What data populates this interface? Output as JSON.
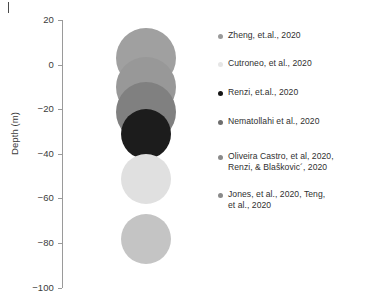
{
  "chart_data": {
    "type": "scatter",
    "title": "",
    "xlabel": "",
    "ylabel": "Depth (m)",
    "ylim": [
      -100,
      20
    ],
    "yticks": [
      20,
      0,
      -20,
      -40,
      -60,
      -80,
      -100
    ],
    "ytick_labels": [
      "20",
      "0",
      "−20",
      "−40",
      "−60",
      "−80",
      "−100"
    ],
    "grid": false,
    "legend_position": "right",
    "x_axis_visible": false,
    "points": [
      {
        "label": "Zheng, et.al., 2020",
        "depth": 3,
        "radius_px": 30,
        "color": "#a0a0a0"
      },
      {
        "label": "Cutroneo, et al., 2020",
        "depth": -10,
        "radius_px": 30,
        "color": "#989898"
      },
      {
        "label": "Renzi, et.al., 2020",
        "depth": -21,
        "radius_px": 30,
        "color": "#808080"
      },
      {
        "label": "Nematollahi et al., 2020",
        "depth": -31,
        "radius_px": 25,
        "color": "#1c1c1c"
      },
      {
        "label": "Oliveira Castro, et al, 2020, Renzi, & Blaškovic´, 2020",
        "depth": -51,
        "radius_px": 25,
        "color": "#e0e0e0"
      },
      {
        "label": "Jones, et al., 2020, Teng, et al., 2020",
        "depth": -78,
        "radius_px": 25,
        "color": "#c4c4c4"
      }
    ]
  },
  "axis": {
    "ylabel": "Depth (m)",
    "ticks": [
      {
        "value": "20"
      },
      {
        "value": "0"
      },
      {
        "value": "−20"
      },
      {
        "value": "−40"
      },
      {
        "value": "−60"
      },
      {
        "value": "−80"
      },
      {
        "value": "−100"
      }
    ]
  },
  "legend": {
    "entries": [
      {
        "label": "Zheng, et.al., 2020",
        "color": "#9a9a9a"
      },
      {
        "label": "Cutroneo, et al., 2020",
        "color": "#e6e6e6"
      },
      {
        "label": "Renzi, et.al., 2020",
        "color": "#151515"
      },
      {
        "label": "Nematollahi et al., 2020",
        "color": "#6e6e6e"
      },
      {
        "label": "Oliveira Castro, et al, 2020,\nRenzi, & Blaškovic´, 2020",
        "color": "#8a8a8a"
      },
      {
        "label": "Jones, et al., 2020, Teng,\net al., 2020",
        "color": "#8a8a8a"
      }
    ]
  }
}
